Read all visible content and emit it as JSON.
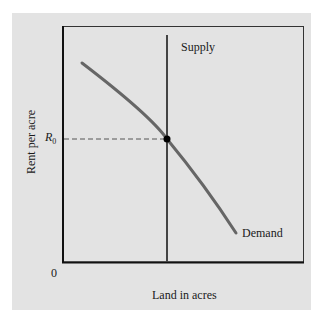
{
  "diagram": {
    "type": "supply-demand",
    "x_axis_label": "Land in acres",
    "y_axis_label": "Rent per acre",
    "origin_label": "0",
    "price_label": "R",
    "price_subscript": "0",
    "curves": [
      {
        "name": "Supply",
        "label": "Supply",
        "shape": "vertical line",
        "color": "#444444"
      },
      {
        "name": "Demand",
        "label": "Demand",
        "shape": "downward-sloping concave curve",
        "color": "#666666"
      }
    ],
    "equilibrium": {
      "label": "R0",
      "marker": "black dot",
      "guide": "dashed horizontal line to y-axis"
    },
    "colors": {
      "panel": "#e3e3e3",
      "axes": "#111111",
      "supply": "#444444",
      "demand": "#666666"
    }
  }
}
